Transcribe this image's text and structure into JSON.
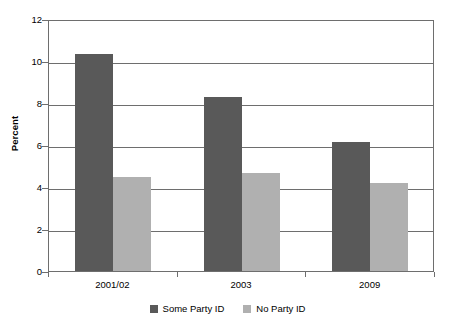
{
  "chart_data": {
    "type": "bar",
    "title": "",
    "xlabel": "",
    "ylabel": "Percent",
    "categories": [
      "2001/02",
      "2003",
      "2009"
    ],
    "series": [
      {
        "name": "Some Party ID",
        "color": "#595959",
        "values": [
          10.35,
          8.3,
          6.15
        ]
      },
      {
        "name": "No Party ID",
        "color": "#b0b0b0",
        "values": [
          4.5,
          4.65,
          4.2
        ]
      }
    ],
    "ylim": [
      0,
      12
    ],
    "ytick_step": 2,
    "yticks": [
      12,
      10,
      8,
      6,
      4,
      2,
      0
    ],
    "ytick_labels": [
      "12",
      "10",
      "8",
      "6",
      "4",
      "2",
      "0"
    ],
    "grid": "horizontal",
    "legend_position": "bottom-center",
    "annotations": []
  },
  "axes": {
    "y_title": "Percent"
  },
  "legend": {
    "entries": [
      {
        "label": "Some Party ID",
        "swatch": "dark-gray-swatch-icon"
      },
      {
        "label": "No Party ID",
        "swatch": "light-gray-swatch-icon"
      }
    ]
  }
}
